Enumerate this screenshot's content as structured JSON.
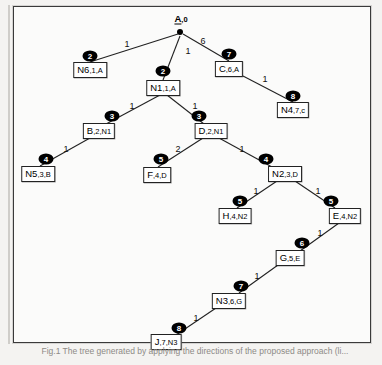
{
  "figure": {
    "title": "A,0",
    "caption": "Fig.1  The tree generated by applying the directions of the proposed approach (li...",
    "colors": {
      "background": "#f4f3f1",
      "panel": "#fbfbfa",
      "line": "#222222",
      "badge_fill": "#000000",
      "badge_text": "#ffffff",
      "box_border": "#222222",
      "box_fill": "#ffffff"
    }
  },
  "root": {
    "name": "A",
    "sub": ",0",
    "x": 180,
    "y": 32
  },
  "nodes": [
    {
      "id": "N6",
      "name": "N6",
      "sub": ",1,A",
      "x": 90,
      "y": 70
    },
    {
      "id": "N1",
      "name": "N1",
      "sub": ",1,A",
      "x": 163,
      "y": 88
    },
    {
      "id": "C",
      "name": "C",
      "sub": ",6,A",
      "x": 229,
      "y": 69
    },
    {
      "id": "N4",
      "name": "N4",
      "sub": ",7,c",
      "x": 293,
      "y": 110
    },
    {
      "id": "B",
      "name": "B",
      "sub": ",2,N1",
      "x": 99,
      "y": 131
    },
    {
      "id": "D",
      "name": "D",
      "sub": ",2,N1",
      "x": 211,
      "y": 131
    },
    {
      "id": "N5",
      "name": "N5",
      "sub": ",3,B",
      "x": 38,
      "y": 174
    },
    {
      "id": "F",
      "name": "F",
      "sub": ",4,D",
      "x": 157,
      "y": 175
    },
    {
      "id": "N2",
      "name": "N2",
      "sub": ",3,D",
      "x": 285,
      "y": 174
    },
    {
      "id": "H",
      "name": "H",
      "sub": ",4,N2",
      "x": 235,
      "y": 216
    },
    {
      "id": "E",
      "name": "E",
      "sub": ",4,N2",
      "x": 345,
      "y": 216
    },
    {
      "id": "G",
      "name": "G",
      "sub": ",5,E",
      "x": 290,
      "y": 258
    },
    {
      "id": "N3",
      "name": "N3",
      "sub": ",6,G",
      "x": 229,
      "y": 301
    },
    {
      "id": "J",
      "name": "J",
      "sub": ",7,N3",
      "x": 166,
      "y": 342
    }
  ],
  "edges": [
    {
      "from": "A",
      "to": "N6",
      "weight": "1",
      "wx": 127,
      "wy": 44,
      "x1": 178,
      "y1": 34,
      "x2": 90,
      "y2": 62
    },
    {
      "from": "A",
      "to": "N1",
      "weight": "1",
      "wx": 188,
      "wy": 51,
      "x1": 180,
      "y1": 36,
      "x2": 163,
      "y2": 80
    },
    {
      "from": "A",
      "to": "C",
      "weight": "6",
      "wx": 203,
      "wy": 41,
      "x1": 183,
      "y1": 34,
      "x2": 229,
      "y2": 61
    },
    {
      "from": "C",
      "to": "N4",
      "weight": "1",
      "wx": 265,
      "wy": 79,
      "x1": 243,
      "y1": 76,
      "x2": 293,
      "y2": 102
    },
    {
      "from": "N1",
      "to": "B",
      "weight": "1",
      "wx": 132,
      "wy": 106,
      "x1": 160,
      "y1": 95,
      "x2": 106,
      "y2": 124
    },
    {
      "from": "N1",
      "to": "D",
      "weight": "1",
      "wx": 195,
      "wy": 106,
      "x1": 167,
      "y1": 95,
      "x2": 204,
      "y2": 124
    },
    {
      "from": "B",
      "to": "N5",
      "weight": "1",
      "wx": 66,
      "wy": 149,
      "x1": 90,
      "y1": 138,
      "x2": 40,
      "y2": 166
    },
    {
      "from": "D",
      "to": "F",
      "weight": "2",
      "wx": 178,
      "wy": 149,
      "x1": 203,
      "y1": 138,
      "x2": 158,
      "y2": 167
    },
    {
      "from": "D",
      "to": "N2",
      "weight": "1",
      "wx": 242,
      "wy": 149,
      "x1": 219,
      "y1": 138,
      "x2": 272,
      "y2": 167
    },
    {
      "from": "N2",
      "to": "H",
      "weight": "1",
      "wx": 256,
      "wy": 191,
      "x1": 277,
      "y1": 181,
      "x2": 237,
      "y2": 208
    },
    {
      "from": "N2",
      "to": "E",
      "weight": "1",
      "wx": 318,
      "wy": 191,
      "x1": 295,
      "y1": 181,
      "x2": 335,
      "y2": 208
    },
    {
      "from": "E",
      "to": "G",
      "weight": "1",
      "wx": 320,
      "wy": 233,
      "x1": 339,
      "y1": 223,
      "x2": 300,
      "y2": 251
    },
    {
      "from": "G",
      "to": "N3",
      "weight": "1",
      "wx": 257,
      "wy": 276,
      "x1": 278,
      "y1": 265,
      "x2": 239,
      "y2": 293
    },
    {
      "from": "N3",
      "to": "J",
      "weight": "1",
      "wx": 196,
      "wy": 318,
      "x1": 216,
      "y1": 308,
      "x2": 176,
      "y2": 335
    }
  ],
  "badges": [
    {
      "step": "2",
      "x": 90,
      "y": 56,
      "for": "N6"
    },
    {
      "step": "2",
      "x": 163,
      "y": 71,
      "for": "N1"
    },
    {
      "step": "7",
      "x": 229,
      "y": 54,
      "for": "C"
    },
    {
      "step": "8",
      "x": 293,
      "y": 96,
      "for": "N4"
    },
    {
      "step": "3",
      "x": 112,
      "y": 116,
      "for": "B"
    },
    {
      "step": "3",
      "x": 199,
      "y": 116,
      "for": "D"
    },
    {
      "step": "4",
      "x": 46,
      "y": 159,
      "for": "N5"
    },
    {
      "step": "5",
      "x": 161,
      "y": 159,
      "for": "F"
    },
    {
      "step": "4",
      "x": 266,
      "y": 159,
      "for": "N2"
    },
    {
      "step": "5",
      "x": 240,
      "y": 201,
      "for": "H"
    },
    {
      "step": "5",
      "x": 331,
      "y": 201,
      "for": "E"
    },
    {
      "step": "6",
      "x": 302,
      "y": 243,
      "for": "G"
    },
    {
      "step": "7",
      "x": 241,
      "y": 286,
      "for": "N3"
    },
    {
      "step": "8",
      "x": 179,
      "y": 328,
      "for": "J"
    }
  ]
}
